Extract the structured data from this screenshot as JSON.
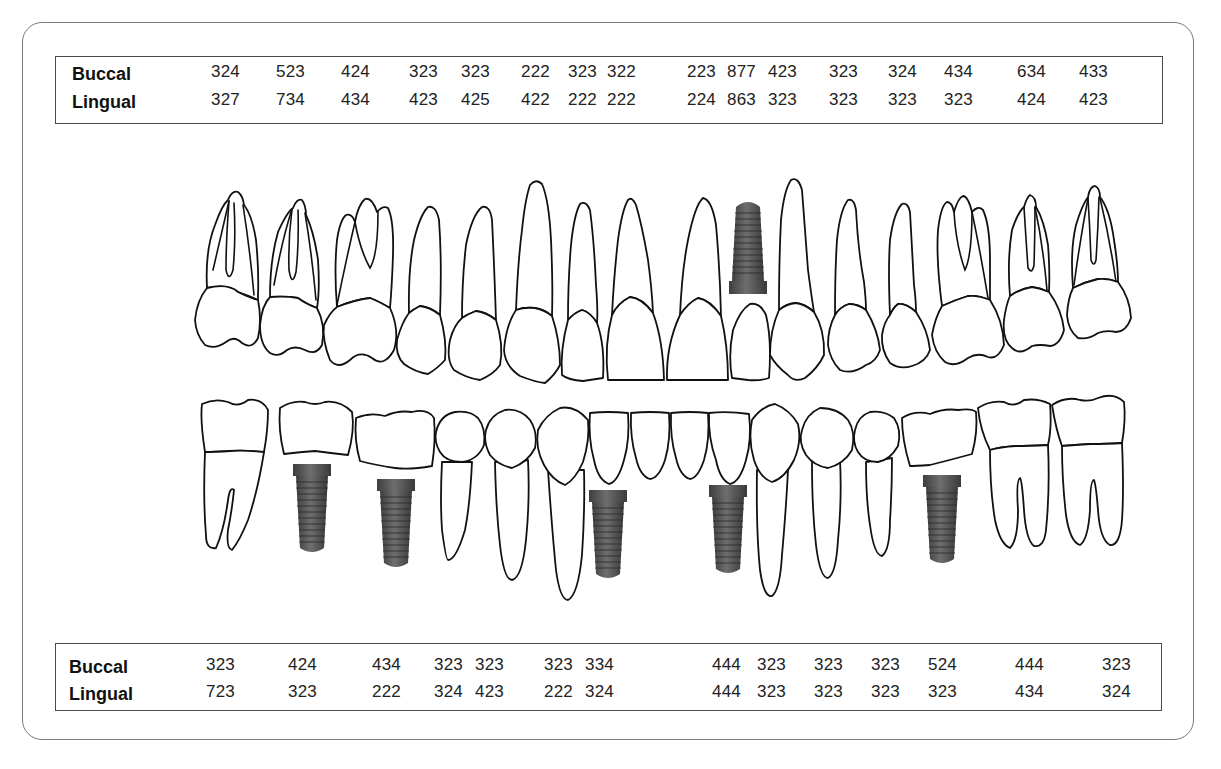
{
  "chart_title": "Dental implant chart with probing depths",
  "upper_table": {
    "rows": [
      {
        "label": "Buccal",
        "values": [
          "324",
          "523",
          "424",
          "323",
          "323",
          "222",
          "323",
          "322",
          "223",
          "877",
          "423",
          "323",
          "324",
          "434",
          "634",
          "433"
        ]
      },
      {
        "label": "Lingual",
        "values": [
          "327",
          "734",
          "434",
          "423",
          "425",
          "422",
          "222",
          "222",
          "224",
          "863",
          "323",
          "323",
          "323",
          "323",
          "424",
          "423"
        ]
      }
    ],
    "column_x": [
      210,
      275,
      340,
      408,
      460,
      520,
      567,
      606,
      686,
      726,
      767,
      828,
      887,
      943,
      1016,
      1078
    ]
  },
  "lower_table": {
    "rows": [
      {
        "label": "Buccal",
        "values": [
          "323",
          "424",
          "434",
          "323",
          "323",
          "323",
          "334",
          "444",
          "323",
          "323",
          "323",
          "524",
          "444",
          "323"
        ]
      },
      {
        "label": "Lingual",
        "values": [
          "723",
          "323",
          "222",
          "324",
          "423",
          "222",
          "324",
          "444",
          "323",
          "323",
          "323",
          "323",
          "434",
          "324"
        ]
      }
    ],
    "column_x": [
      205,
      287,
      371,
      433,
      474,
      543,
      584,
      711,
      756,
      813,
      870,
      927,
      1014,
      1101
    ]
  },
  "upper_arch": {
    "teeth_count": 16,
    "implants": [
      {
        "position": "upper-left-central-region",
        "x": 748
      }
    ]
  },
  "lower_arch": {
    "teeth_count": 16,
    "implants": [
      {
        "position": "lower-right-second-molar-region",
        "x": 312
      },
      {
        "position": "lower-right-second-premolar-region",
        "x": 396
      },
      {
        "position": "lower-right-lateral-incisor-region",
        "x": 608
      },
      {
        "position": "lower-left-lateral-incisor-region",
        "x": 728
      },
      {
        "position": "lower-left-second-premolar-region",
        "x": 942
      }
    ]
  },
  "colors": {
    "frame": "#7a7a7a",
    "table_border": "#4a4a4a",
    "tooth_outline": "#111111",
    "implant": "#5a5a5a"
  }
}
